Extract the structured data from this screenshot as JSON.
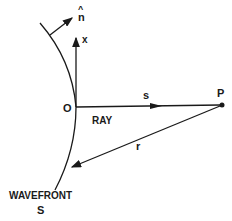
{
  "diagram": {
    "labels": {
      "normal": "n",
      "normal_hat": "^",
      "x_axis": "x",
      "origin": "O",
      "ray_segment": "s",
      "point": "P",
      "ray": "RAY",
      "distance": "r",
      "wavefront": "WAVEFRONT",
      "surface": "S"
    },
    "colors": {
      "stroke": "#1a1a1a",
      "background": "#ffffff"
    }
  }
}
